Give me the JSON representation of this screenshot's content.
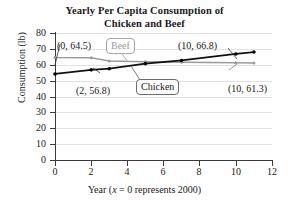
{
  "chart_data": {
    "type": "line",
    "title": "Yearly Per Capita Consumption of Chicken and Beef",
    "title_line1": "Yearly Per Capita Consumption of",
    "title_line2": "Chicken and Beef",
    "xlabel_prefix": "Year (",
    "xlabel_italic": "x",
    "xlabel_suffix": " = 0 represents 2000)",
    "xlabel": "Year (x = 0 represents 2000)",
    "ylabel": "Consumption (lb)",
    "xlim": [
      0,
      12
    ],
    "ylim": [
      0,
      80
    ],
    "xticks": [
      0,
      2,
      4,
      6,
      8,
      10,
      12
    ],
    "yticks": [
      0,
      10,
      20,
      30,
      40,
      50,
      60,
      70,
      80
    ],
    "grid": "horizontal",
    "legend": "callout-labels",
    "series": [
      {
        "name": "Chicken",
        "color": "#000000",
        "x": [
          0,
          2,
          3,
          5,
          7,
          10,
          11
        ],
        "values": [
          54.2,
          56.8,
          57.5,
          60.7,
          62.7,
          66.8,
          68.0
        ]
      },
      {
        "name": "Beef",
        "color": "#9a9a9a",
        "x": [
          0,
          2,
          3,
          5,
          7,
          10,
          11
        ],
        "values": [
          64.5,
          64.4,
          62.4,
          61.9,
          61.6,
          61.3,
          61.1
        ]
      }
    ],
    "annotations": [
      {
        "text": "(0, 64.5)",
        "series": "Beef",
        "point": [
          0,
          64.5
        ]
      },
      {
        "text": "(2, 56.8)",
        "series": "Chicken",
        "point": [
          2,
          56.8
        ]
      },
      {
        "text": "(10, 66.8)",
        "series": "Chicken",
        "point": [
          10,
          66.8
        ]
      },
      {
        "text": "(10, 61.3)",
        "series": "Beef",
        "point": [
          10,
          61.3
        ]
      }
    ],
    "callouts": [
      {
        "text": "Beef",
        "color": "#9a9a9a"
      },
      {
        "text": "Chicken",
        "color": "#000000"
      }
    ]
  },
  "yticklabels": [
    "80",
    "70",
    "60",
    "50",
    "40",
    "30",
    "20",
    "10",
    "0"
  ],
  "xticklabels": [
    "0",
    "2",
    "4",
    "6",
    "8",
    "10",
    "12"
  ],
  "labels": {
    "beef_start": "(0, 64.5)",
    "chicken_two": "(2, 56.8)",
    "chicken_ten": "(10, 66.8)",
    "beef_ten": "(10, 61.3)",
    "callout_beef": "Beef",
    "callout_chicken": "Chicken"
  }
}
